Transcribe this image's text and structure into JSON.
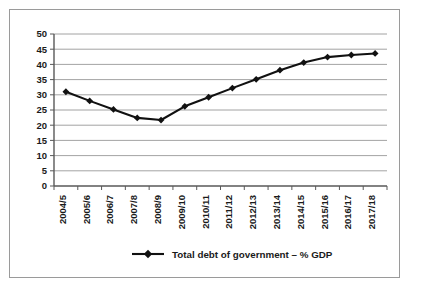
{
  "chart_data": {
    "type": "line",
    "title": "",
    "xlabel": "",
    "ylabel": "",
    "ylim": [
      0,
      50
    ],
    "ytick_step": 5,
    "grid": true,
    "legend_position": "bottom",
    "legend_marker": "diamond",
    "series_color": "#111111",
    "gridline_color": "#8c8c8c",
    "axis_color": "#595959",
    "border_color": "#9a9a9a",
    "categories": [
      "2004/5",
      "2005/6",
      "2006/7",
      "2007/8",
      "2008/9",
      "2009/10",
      "2010/11",
      "2011/12",
      "2012/13",
      "2013/14",
      "2014/15",
      "2015/16",
      "2016/17",
      "2017/18"
    ],
    "yticks": [
      "0",
      "5",
      "10",
      "15",
      "20",
      "25",
      "30",
      "35",
      "40",
      "45",
      "50"
    ],
    "series": [
      {
        "name": "Total debt of government – % GDP",
        "values": [
          31.0,
          28.0,
          25.2,
          22.4,
          21.7,
          26.2,
          29.2,
          32.2,
          35.1,
          38.1,
          40.6,
          42.4,
          43.1,
          43.6
        ]
      }
    ]
  },
  "legend": {
    "entries": [
      {
        "label": "Total debt of government – % GDP"
      }
    ]
  }
}
